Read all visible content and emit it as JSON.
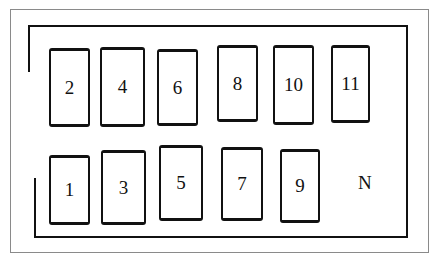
{
  "diagram": {
    "type": "fuse-box-layout",
    "slots": [
      {
        "id": "2",
        "label": "2",
        "x": 49,
        "y": 48,
        "w": 41,
        "h": 79
      },
      {
        "id": "4",
        "label": "4",
        "x": 100,
        "y": 47,
        "w": 45,
        "h": 80
      },
      {
        "id": "6",
        "label": "6",
        "x": 157,
        "y": 49,
        "w": 41,
        "h": 77
      },
      {
        "id": "8",
        "label": "8",
        "x": 217,
        "y": 45,
        "w": 41,
        "h": 77
      },
      {
        "id": "10",
        "label": "10",
        "x": 273,
        "y": 45,
        "w": 41,
        "h": 80
      },
      {
        "id": "11",
        "label": "11",
        "x": 331,
        "y": 45,
        "w": 39,
        "h": 78
      },
      {
        "id": "1",
        "label": "1",
        "x": 49,
        "y": 155,
        "w": 41,
        "h": 70
      },
      {
        "id": "3",
        "label": "3",
        "x": 101,
        "y": 150,
        "w": 45,
        "h": 75
      },
      {
        "id": "5",
        "label": "5",
        "x": 159,
        "y": 145,
        "w": 44,
        "h": 76
      },
      {
        "id": "7",
        "label": "7",
        "x": 221,
        "y": 147,
        "w": 42,
        "h": 74
      },
      {
        "id": "9",
        "label": "9",
        "x": 280,
        "y": 149,
        "w": 40,
        "h": 74
      }
    ],
    "extra_label": {
      "text": "N",
      "x": 358,
      "y": 172
    }
  }
}
